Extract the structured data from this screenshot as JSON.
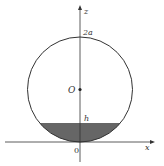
{
  "diagram": {
    "labels": {
      "z_axis": "z",
      "x_axis": "x",
      "top": "2a",
      "center": "O",
      "level": "h",
      "origin": "0"
    },
    "colors": {
      "stroke": "#333333",
      "fill": "#666666"
    }
  }
}
